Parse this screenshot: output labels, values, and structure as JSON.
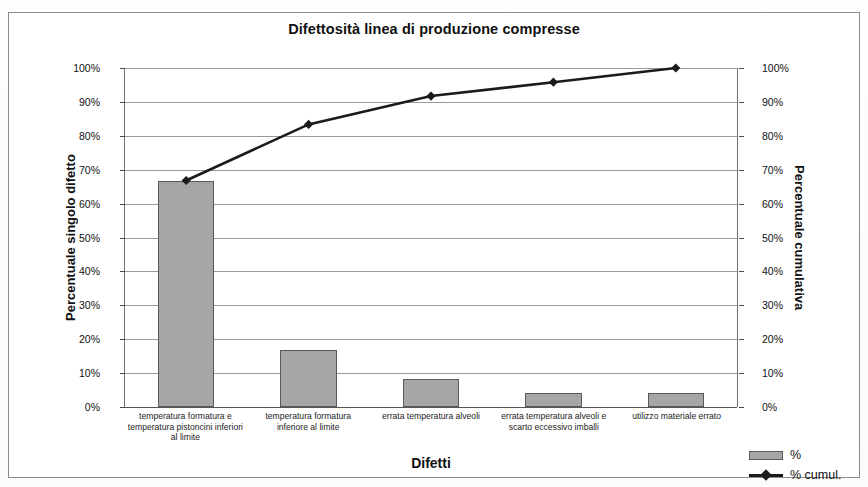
{
  "chart_data": {
    "type": "bar",
    "title": "Difettosità linea di produzione compresse",
    "xlabel": "Difetti",
    "ylabel": "Percentuale singolo difetto",
    "y2label": "Percentuale cumulativa",
    "ylim": [
      0,
      100
    ],
    "y2lim": [
      0,
      100
    ],
    "grid": true,
    "legend_position": "bottom-right",
    "categories": [
      "temperatura formatura e temperatura pistoncini inferiori al limite",
      "temperatura formatura inferiore al limite",
      "errata temperatura alveoli",
      "errata temperatura alveoli e scarto eccessivo imballi",
      "utilizzo materiale errato"
    ],
    "series": [
      {
        "name": "%",
        "type": "bar",
        "values": [
          66.7,
          16.7,
          8.3,
          4.2,
          4.2
        ],
        "color": "#a6a6a6"
      },
      {
        "name": "% cumul.",
        "type": "line",
        "values": [
          66.7,
          83.3,
          91.7,
          95.8,
          100.0
        ],
        "color": "#1b1b1b"
      }
    ],
    "ytick_labels": [
      "100%",
      "90%",
      "80%",
      "70%",
      "60%",
      "50%",
      "40%",
      "30%",
      "20%",
      "10%",
      "0%"
    ],
    "ytick_values": [
      100,
      90,
      80,
      70,
      60,
      50,
      40,
      30,
      20,
      10,
      0
    ],
    "y2tick_labels": [
      "100%",
      "90%",
      "80%",
      "70%",
      "60%",
      "50%",
      "40%",
      "30%",
      "20%",
      "10%",
      "0%"
    ],
    "y2tick_values": [
      100,
      90,
      80,
      70,
      60,
      50,
      40,
      30,
      20,
      10,
      0
    ]
  },
  "legend": {
    "items": [
      {
        "label": "%"
      },
      {
        "label": "% cumul."
      }
    ]
  }
}
